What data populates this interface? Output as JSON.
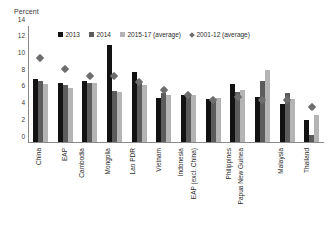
{
  "chart_data": {
    "type": "bar",
    "title": "",
    "ylabel": "Percent",
    "xlabel": "",
    "ylim": [
      0,
      14
    ],
    "yticks": [
      0,
      2,
      4,
      6,
      8,
      10,
      12,
      14
    ],
    "grid": false,
    "legend_position": "top-center",
    "categories": [
      "China",
      "EAP",
      "Cambodia",
      "Mongolia",
      "Lao PDR",
      "Vietnam",
      "Indonesia",
      "EAP (excl. China)",
      "Philippines",
      "Papua New Guinea",
      "Malaysia",
      "Thailand"
    ],
    "series": [
      {
        "name": "2013",
        "type": "bar",
        "color": "#121212",
        "values": [
          7.7,
          7.2,
          7.4,
          11.7,
          8.5,
          5.4,
          5.8,
          5.3,
          7.1,
          5.5,
          4.7,
          2.7
        ]
      },
      {
        "name": "2014",
        "type": "bar",
        "color": "#5c5c5c",
        "values": [
          7.4,
          7.0,
          7.2,
          6.2,
          7.3,
          6.0,
          5.6,
          5.1,
          6.1,
          7.4,
          6.0,
          1.0
        ]
      },
      {
        "name": "2015-17 (average)",
        "type": "bar",
        "color": "#b4b4b4",
        "values": [
          7.1,
          6.6,
          7.2,
          6.1,
          6.9,
          5.7,
          5.8,
          5.4,
          6.4,
          8.7,
          5.3,
          3.3
        ]
      },
      {
        "name": "2001-12 (average)",
        "type": "marker",
        "color": "#6e6e6e",
        "values": [
          10.2,
          8.8,
          8.0,
          8.0,
          7.3,
          6.4,
          5.8,
          5.1,
          5.5,
          5.2,
          5.2,
          4.3
        ]
      }
    ]
  }
}
